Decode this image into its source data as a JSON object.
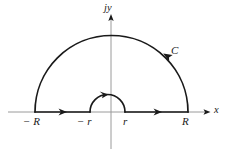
{
  "figure": {
    "background_color": "#ffffff",
    "contour_color": "#1a1a1a",
    "axis_color": "#9a9a9a",
    "axes": {
      "horizontal": {
        "label": "x",
        "label_x": 214,
        "label_y": 106,
        "y": 112,
        "x_start": 8,
        "x_end": 210
      },
      "vertical": {
        "label": "jy",
        "label_x": 104,
        "label_y": 4,
        "x": 111,
        "y_start": 14,
        "y_end": 149
      }
    },
    "contour": {
      "name": "C",
      "label": "C",
      "label_x": 171,
      "label_y": 46,
      "outer_radius_label_right": "R",
      "outer_radius_label_left": "− R",
      "inner_radius_label_right": "r",
      "inner_radius_label_left": "− r",
      "center_x": 111.5,
      "baseline_y": 112,
      "outer_radius": 76.5,
      "inner_radius": 17.5,
      "inner_center_x": 107.5,
      "direction": "counterclockwise"
    },
    "point_labels": [
      {
        "name": "minus-R",
        "text": "− R",
        "x": 24,
        "y": 117
      },
      {
        "name": "minus-r",
        "text": "− r",
        "x": 78,
        "y": 117
      },
      {
        "name": "r",
        "text": "r",
        "x": 123,
        "y": 117
      },
      {
        "name": "R",
        "text": "R",
        "x": 182,
        "y": 117
      }
    ]
  }
}
